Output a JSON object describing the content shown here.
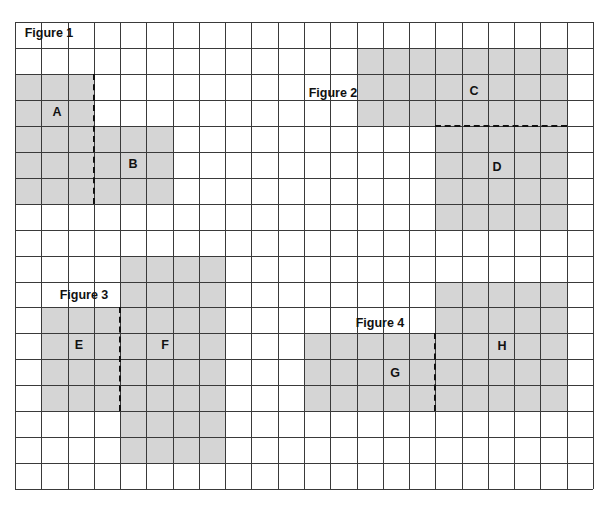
{
  "grid": {
    "origin_x": 15,
    "origin_y": 22,
    "cols": 22,
    "rows": 18,
    "cell_w": 26.27,
    "cell_h": 25.95,
    "line_color": "#3a3a3a",
    "shade_color": "#d5d5d5"
  },
  "figures": [
    {
      "title": "Figure 1",
      "title_pos": [
        49,
        33
      ],
      "regions": [
        {
          "label": "A",
          "cells": {
            "col": 0,
            "row": 2,
            "w": 3,
            "h": 5
          },
          "label_pos": [
            57,
            112
          ]
        },
        {
          "label": "B",
          "cells": {
            "col": 3,
            "row": 4,
            "w": 3,
            "h": 3
          },
          "label_pos": [
            133,
            164
          ]
        }
      ],
      "cut": {
        "orientation": "vertical",
        "col_line": 3,
        "row_from": 2,
        "row_to": 7
      }
    },
    {
      "title": "Figure 2",
      "title_pos": [
        333,
        93
      ],
      "regions": [
        {
          "label": "C",
          "cells": {
            "col": 13,
            "row": 1,
            "w": 8,
            "h": 3
          },
          "label_pos": [
            474,
            91
          ]
        },
        {
          "label": "D",
          "cells": {
            "col": 16,
            "row": 4,
            "w": 5,
            "h": 4
          },
          "label_pos": [
            497,
            167
          ]
        }
      ],
      "cut": {
        "orientation": "horizontal",
        "row_line": 4,
        "col_from": 16,
        "col_to": 21
      }
    },
    {
      "title": "Figure 3",
      "title_pos": [
        84,
        295
      ],
      "regions": [
        {
          "label": "E",
          "cells": {
            "col": 1,
            "row": 11,
            "w": 3,
            "h": 4
          },
          "label_pos": [
            79,
            345
          ]
        },
        {
          "label": "F",
          "cells": {
            "col": 4,
            "row": 9,
            "w": 4,
            "h": 8
          },
          "label_pos": [
            165,
            345
          ]
        }
      ],
      "cut": {
        "orientation": "vertical",
        "col_line": 4,
        "row_from": 11,
        "row_to": 15
      }
    },
    {
      "title": "Figure 4",
      "title_pos": [
        380,
        323
      ],
      "regions": [
        {
          "label": "G",
          "cells": {
            "col": 11,
            "row": 12,
            "w": 5,
            "h": 3
          },
          "label_pos": [
            395,
            373
          ]
        },
        {
          "label": "H",
          "cells": {
            "col": 16,
            "row": 10,
            "w": 5,
            "h": 5
          },
          "label_pos": [
            502,
            346
          ]
        }
      ],
      "cut": {
        "orientation": "vertical",
        "col_line": 16,
        "row_from": 12,
        "row_to": 15
      }
    }
  ]
}
